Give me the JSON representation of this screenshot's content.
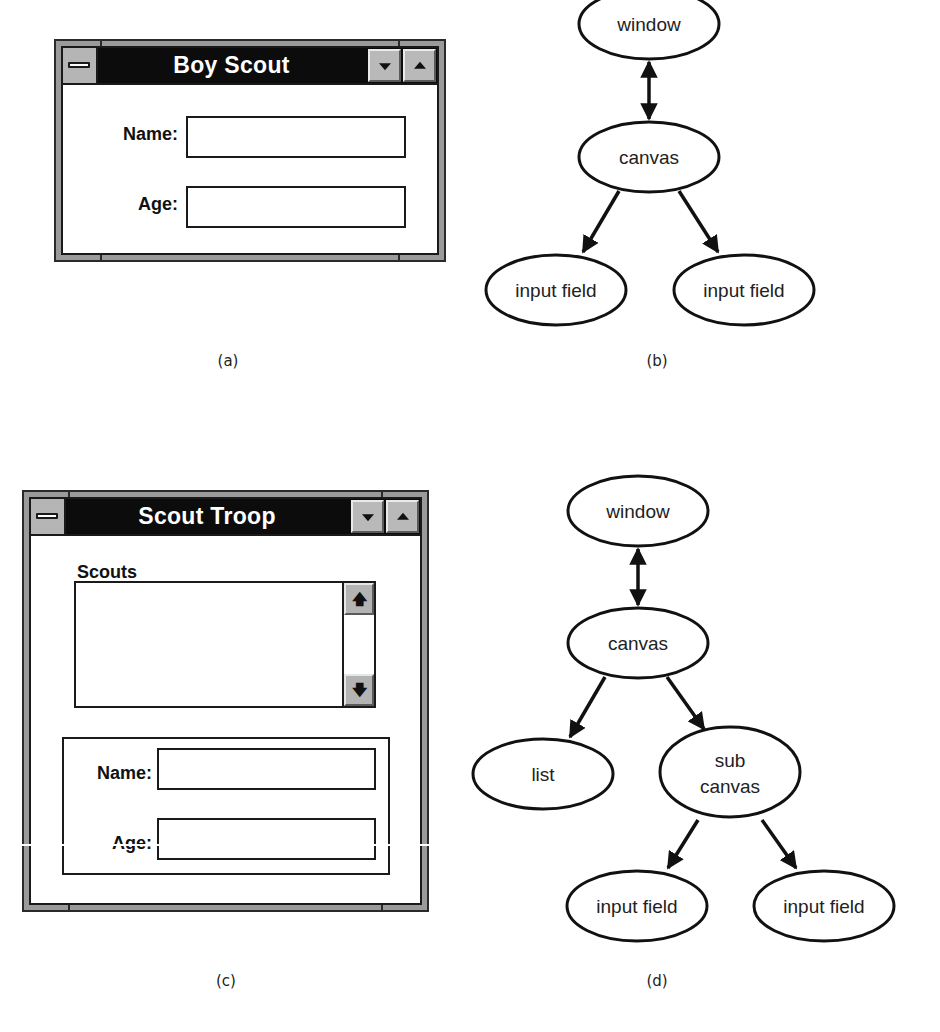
{
  "figure_a": {
    "caption": "(a)",
    "window": {
      "title": "Boy Scout",
      "fields": [
        {
          "label": "Name:",
          "value": ""
        },
        {
          "label": "Age:",
          "value": ""
        }
      ]
    }
  },
  "figure_b": {
    "caption": "(b)",
    "nodes": {
      "window": "window",
      "canvas": "canvas",
      "input1": "input field",
      "input2": "input field"
    },
    "edges": [
      {
        "from": "window",
        "to": "canvas",
        "type": "bidirectional"
      },
      {
        "from": "canvas",
        "to": "input1",
        "type": "directed"
      },
      {
        "from": "canvas",
        "to": "input2",
        "type": "directed"
      }
    ]
  },
  "figure_c": {
    "caption": "(c)",
    "window": {
      "title": "Scout Troop",
      "list_label": "Scouts",
      "list_items": [],
      "scroll_up_glyph": "🡅",
      "scroll_down_glyph": "🡇",
      "fields": [
        {
          "label": "Name:",
          "value": ""
        },
        {
          "label": "Age:",
          "value": ""
        }
      ]
    }
  },
  "figure_d": {
    "caption": "(d)",
    "nodes": {
      "window": "window",
      "canvas": "canvas",
      "list": "list",
      "subcanvas_line1": "sub",
      "subcanvas_line2": "canvas",
      "input1": "input field",
      "input2": "input field"
    },
    "edges": [
      {
        "from": "window",
        "to": "canvas",
        "type": "bidirectional"
      },
      {
        "from": "canvas",
        "to": "list",
        "type": "directed"
      },
      {
        "from": "canvas",
        "to": "subcanvas",
        "type": "directed"
      },
      {
        "from": "subcanvas",
        "to": "input1",
        "type": "directed"
      },
      {
        "from": "subcanvas",
        "to": "input2",
        "type": "directed"
      }
    ]
  }
}
